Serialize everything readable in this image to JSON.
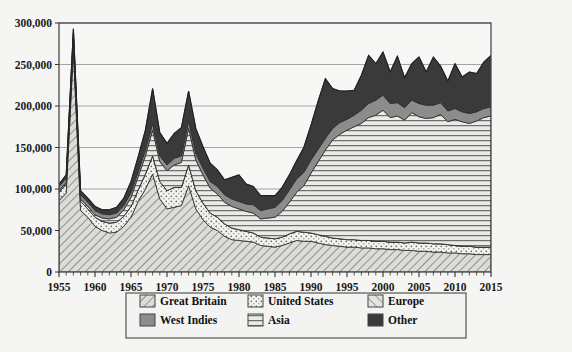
{
  "chart_data": {
    "type": "area",
    "title": "",
    "subtitle": "",
    "xlabel": "",
    "ylabel": "",
    "stacked": true,
    "grid": true,
    "legend_position": "bottom",
    "xlim": [
      1955,
      2015
    ],
    "ylim": [
      0,
      300000
    ],
    "ytick_values": [
      0,
      50000,
      100000,
      150000,
      200000,
      250000,
      300000
    ],
    "ytick_labels": [
      "0",
      "50,000",
      "100,000",
      "150,000",
      "200,000",
      "250,000",
      "300,000"
    ],
    "xtick_labels": [
      "1955",
      "1960",
      "1965",
      "1970",
      "1975",
      "1980",
      "1985",
      "1990",
      "1995",
      "2000",
      "2005",
      "2010",
      "2015"
    ],
    "xtick_values": [
      1955,
      1960,
      1965,
      1970,
      1975,
      1980,
      1985,
      1990,
      1995,
      2000,
      2005,
      2010,
      2015
    ],
    "minor_xticks_every": 1,
    "x": [
      1955,
      1956,
      1957,
      1958,
      1959,
      1960,
      1961,
      1962,
      1963,
      1964,
      1965,
      1966,
      1967,
      1968,
      1969,
      1970,
      1971,
      1972,
      1973,
      1974,
      1975,
      1976,
      1977,
      1978,
      1979,
      1980,
      1981,
      1982,
      1983,
      1984,
      1985,
      1986,
      1987,
      1988,
      1989,
      1990,
      1991,
      1992,
      1993,
      1994,
      1995,
      1996,
      1997,
      1998,
      1999,
      2000,
      2001,
      2002,
      2003,
      2004,
      2005,
      2006,
      2007,
      2008,
      2009,
      2010,
      2011,
      2012,
      2013,
      2014,
      2015
    ],
    "stack_order_bottom_to_top": [
      "Great Britain",
      "United States",
      "Europe",
      "Asia",
      "West Indies",
      "Other"
    ],
    "series": [
      {
        "name": "Great Britain",
        "pattern": "diagonal-forward-hatch",
        "color": "#d6d6d2",
        "values": [
          86000,
          95000,
          267000,
          74000,
          66000,
          55000,
          50000,
          47000,
          48000,
          55000,
          66000,
          85000,
          100000,
          118000,
          88000,
          76000,
          78000,
          80000,
          104000,
          76000,
          63000,
          54000,
          50000,
          43000,
          39000,
          38000,
          37000,
          36000,
          32000,
          31000,
          30000,
          32000,
          35000,
          38000,
          37000,
          37000,
          35000,
          33000,
          32000,
          31000,
          30000,
          30000,
          29000,
          29000,
          28000,
          28000,
          27000,
          27000,
          26000,
          26000,
          25000,
          25000,
          24000,
          24000,
          23000,
          23000,
          22000,
          22000,
          21000,
          21000,
          21000
        ]
      },
      {
        "name": "United States",
        "pattern": "dotted-stipple",
        "color": "#f0f0ec",
        "values": [
          10000,
          11000,
          12000,
          11000,
          10000,
          11000,
          11000,
          12000,
          12000,
          12000,
          13000,
          14000,
          18000,
          22000,
          21000,
          22000,
          24000,
          22000,
          25000,
          22000,
          20000,
          17000,
          16000,
          15000,
          14000,
          13000,
          12000,
          11000,
          10000,
          10000,
          10000,
          10000,
          11000,
          11000,
          11000,
          10000,
          10000,
          10000,
          9000,
          9000,
          9000,
          9000,
          9000,
          9000,
          9000,
          9000,
          9000,
          9000,
          9000,
          10000,
          10000,
          10000,
          10000,
          10000,
          10000,
          9000,
          9000,
          9000,
          9000,
          9000,
          9000
        ]
      },
      {
        "name": "Europe",
        "pattern": "diagonal-back-hatch",
        "color": "#dedede",
        "values": [
          0,
          0,
          0,
          0,
          0,
          0,
          0,
          0,
          0,
          0,
          0,
          0,
          0,
          0,
          0,
          0,
          0,
          0,
          0,
          0,
          0,
          0,
          0,
          0,
          0,
          0,
          0,
          0,
          0,
          0,
          0,
          0,
          0,
          0,
          0,
          0,
          0,
          0,
          0,
          0,
          0,
          0,
          0,
          0,
          0,
          0,
          0,
          0,
          0,
          0,
          0,
          0,
          0,
          0,
          0,
          0,
          0,
          0,
          0,
          0,
          0
        ]
      },
      {
        "name": "Asia",
        "pattern": "horizontal-lines",
        "color": "#e9e9e5",
        "values": [
          2000,
          2000,
          3000,
          3000,
          3000,
          3000,
          4000,
          5000,
          6000,
          8000,
          11000,
          16000,
          22000,
          31000,
          24000,
          24000,
          27000,
          30000,
          44000,
          37000,
          34000,
          30000,
          28000,
          26000,
          26000,
          25000,
          24000,
          24000,
          22000,
          24000,
          26000,
          31000,
          38000,
          47000,
          56000,
          72000,
          88000,
          104000,
          118000,
          126000,
          132000,
          136000,
          141000,
          148000,
          152000,
          158000,
          150000,
          152000,
          148000,
          156000,
          152000,
          150000,
          152000,
          156000,
          148000,
          152000,
          150000,
          148000,
          152000,
          156000,
          158000
        ]
      },
      {
        "name": "West Indies",
        "pattern": "solid-gray",
        "color": "#8c8c8c",
        "values": [
          5000,
          5000,
          6000,
          5000,
          5000,
          5000,
          5000,
          5000,
          5000,
          5000,
          6000,
          6000,
          7000,
          8000,
          7000,
          7000,
          8000,
          8000,
          9000,
          8000,
          8000,
          8000,
          9000,
          9000,
          9000,
          9000,
          9000,
          10000,
          10000,
          11000,
          12000,
          13000,
          15000,
          16000,
          16000,
          16000,
          15000,
          14000,
          14000,
          14000,
          13000,
          14000,
          16000,
          17000,
          18000,
          18000,
          17000,
          16000,
          15000,
          15000,
          16000,
          16000,
          15000,
          14000,
          13000,
          13000,
          12000,
          12000,
          11000,
          11000,
          11000
        ]
      },
      {
        "name": "Other",
        "pattern": "solid-dark",
        "color": "#3a3a3a",
        "values": [
          3000,
          4000,
          5000,
          5000,
          5000,
          5000,
          5000,
          6000,
          7000,
          9000,
          13000,
          18000,
          24000,
          42000,
          28000,
          26000,
          30000,
          34000,
          36000,
          30000,
          26000,
          22000,
          20000,
          18000,
          26000,
          32000,
          24000,
          22000,
          18000,
          16000,
          14000,
          16000,
          18000,
          22000,
          30000,
          42000,
          58000,
          72000,
          48000,
          38000,
          34000,
          30000,
          42000,
          58000,
          44000,
          52000,
          38000,
          56000,
          36000,
          44000,
          56000,
          40000,
          58000,
          44000,
          36000,
          54000,
          42000,
          50000,
          46000,
          56000,
          62000
        ]
      }
    ],
    "notable_points": [
      {
        "year": 1957,
        "total": 282000,
        "note": "peak driven by Great Britain"
      },
      {
        "year": 1966,
        "total": 219000
      },
      {
        "year": 1973,
        "total": 218000
      },
      {
        "year": 1985,
        "total": 84000,
        "note": "trough"
      },
      {
        "year": 1992,
        "total": 255000
      },
      {
        "year": 2015,
        "total": 271000
      }
    ]
  },
  "legend": {
    "items": [
      {
        "label": "Great Britain",
        "swatch": "gb-swatch"
      },
      {
        "label": "United States",
        "swatch": "us-swatch"
      },
      {
        "label": "Europe",
        "swatch": "eu-swatch"
      },
      {
        "label": "West Indies",
        "swatch": "wi-swatch"
      },
      {
        "label": "Asia",
        "swatch": "asia-swatch"
      },
      {
        "label": "Other",
        "swatch": "other-swatch"
      }
    ]
  },
  "page": {
    "background_color": "#f5f5f3",
    "plot_border_color": "#4a4a4a",
    "gridline_color": "#9a9a9a",
    "caption_fragment": ""
  }
}
